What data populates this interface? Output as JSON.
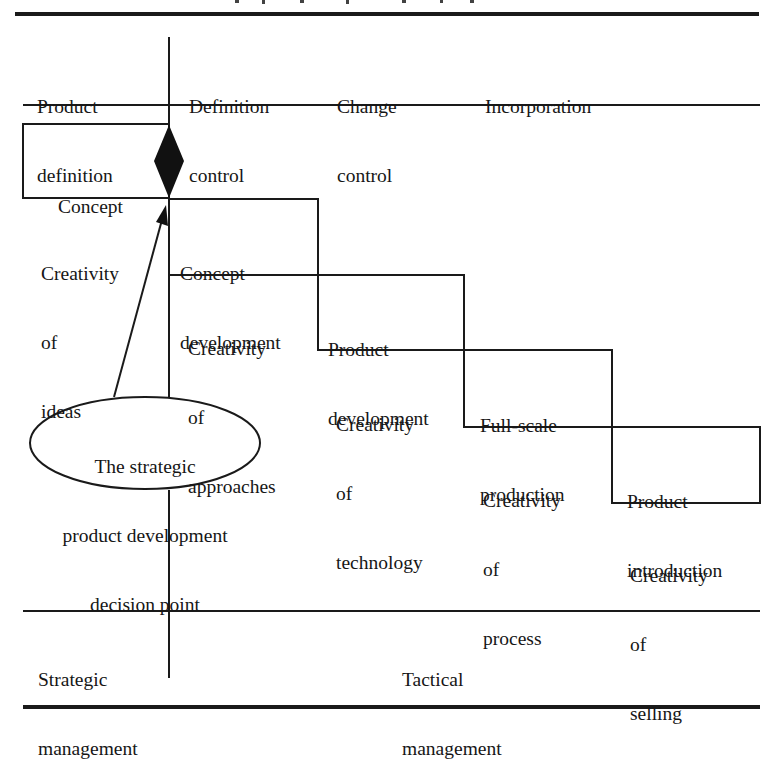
{
  "header": {
    "columns": [
      {
        "lines": [
          "Product",
          "definition"
        ]
      },
      {
        "lines": [
          "Definition",
          "control"
        ]
      },
      {
        "lines": [
          "Change",
          "control"
        ]
      },
      {
        "lines": [
          "Incorporation"
        ]
      }
    ]
  },
  "stages": [
    {
      "name": "concept",
      "lines": [
        "Concept"
      ]
    },
    {
      "name": "concept-development",
      "lines": [
        "Concept",
        "development"
      ]
    },
    {
      "name": "product-development",
      "lines": [
        "Product",
        "development"
      ]
    },
    {
      "name": "full-scale-production",
      "lines": [
        "Full-scale",
        "production"
      ]
    },
    {
      "name": "product-introduction",
      "lines": [
        "Product",
        "introduction"
      ]
    }
  ],
  "creativity": [
    {
      "lines": [
        "Creativity",
        "of",
        "ideas"
      ]
    },
    {
      "lines": [
        "Creativity",
        "of",
        "approaches"
      ]
    },
    {
      "lines": [
        "Creativity",
        "of",
        "technology"
      ]
    },
    {
      "lines": [
        "Creativity",
        "of",
        "process"
      ]
    },
    {
      "lines": [
        "Creativity",
        "of",
        "selling"
      ]
    }
  ],
  "decision_point": {
    "lines": [
      "The strategic",
      "product development",
      "decision point"
    ]
  },
  "footer": {
    "left": {
      "lines": [
        "Strategic",
        "management"
      ]
    },
    "right": {
      "lines": [
        "Tactical",
        "management"
      ]
    }
  },
  "colors": {
    "ink": "#1a1a1a",
    "background": "#ffffff"
  }
}
